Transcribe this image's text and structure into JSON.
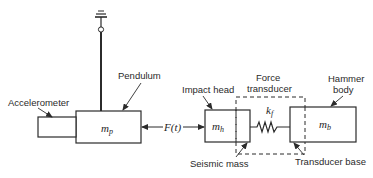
{
  "diagram": {
    "labels": {
      "pendulum": "Pendulum",
      "accelerometer": "Accelerometer",
      "impact_head": "Impact head",
      "force_transducer_line1": "Force",
      "force_transducer_line2": "transducer",
      "hammer_body_line1": "Hammer",
      "hammer_body_line2": "body",
      "seismic_mass": "Seismic mass",
      "transducer_base": "Transducer base"
    },
    "symbols": {
      "pendulum_mass": {
        "base": "m",
        "sub": "p"
      },
      "head_mass": {
        "base": "m",
        "sub": "h"
      },
      "body_mass": {
        "base": "m",
        "sub": "b"
      },
      "stiffness": {
        "base": "k",
        "sub": "f"
      },
      "force": "F(t)"
    },
    "colors": {
      "line": "#2b2b2b",
      "text": "#2a2a2a",
      "background": "#ffffff"
    }
  }
}
